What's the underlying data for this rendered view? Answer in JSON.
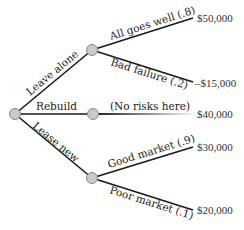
{
  "diagram": {
    "type": "decision-tree",
    "root": {
      "id": "root"
    },
    "decisions": [
      {
        "label": "Leave alone"
      },
      {
        "label": "Rebuild"
      },
      {
        "label": "Lease new"
      }
    ],
    "outcomes": [
      {
        "branch": "Leave alone",
        "label": "All goes well (.8)",
        "value": "$50,000"
      },
      {
        "branch": "Leave alone",
        "label": "Bad failure (.2)",
        "value": "–$15,000"
      },
      {
        "branch": "Rebuild",
        "label": "(No risks here)",
        "value": "$40,000"
      },
      {
        "branch": "Lease new",
        "label": "Good market (.9)",
        "value": "$30,000"
      },
      {
        "branch": "Lease new",
        "label": "Poor market (.1)",
        "value": "$20,000"
      }
    ],
    "colors": {
      "edge": "#1a1a1a",
      "node_fill": "#c9c9c9",
      "node_stroke": "#8a8a8a"
    }
  }
}
